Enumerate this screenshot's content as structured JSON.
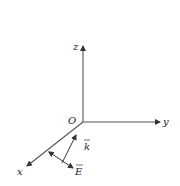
{
  "diagram": {
    "type": "3d-coordinate-axes",
    "origin_label": "O",
    "axes": [
      {
        "name": "z",
        "label": "z",
        "direction": "up"
      },
      {
        "name": "y",
        "label": "y",
        "direction": "right"
      },
      {
        "name": "x",
        "label": "x",
        "direction": "down-left"
      }
    ],
    "vectors": [
      {
        "name": "wave-vector",
        "label": "k",
        "has_arrow_over": true,
        "style": "single-headed"
      },
      {
        "name": "electric-field",
        "label": "E",
        "has_arrow_over": true,
        "style": "double-headed"
      }
    ],
    "colors": {
      "axis": "#333333",
      "text": "#222222",
      "background": "#ffffff"
    }
  }
}
